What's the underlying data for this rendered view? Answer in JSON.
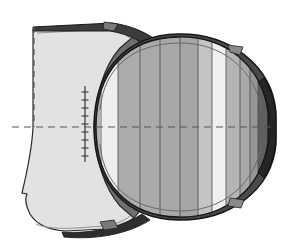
{
  "figure": {
    "title": "",
    "caption": "",
    "type": "technical-cad-render",
    "canvas": {
      "width": 284,
      "height": 250,
      "background": "#ffffff"
    }
  },
  "palette": {
    "background": "#ffffff",
    "outline": "#1a1a1a",
    "outline_soft": "#4a4a4a",
    "lightest": "#f2f2f2",
    "light": "#e2e2e2",
    "light_mid": "#d2d2d2",
    "mid": "#b4b4b4",
    "mid_dark": "#a2a2a2",
    "dark": "#8c8c8c",
    "darker": "#6f6f6f",
    "darkest": "#4f4f4f",
    "near_black": "#3a3a3a",
    "centerline": "#555555"
  },
  "geometry": {
    "centerline_y": 127,
    "centerline_x_start": 12,
    "centerline_x_end": 276,
    "vertical_dashed_x": 34,
    "vertical_dashed_y_top": 27,
    "vertical_dashed_y_bottom": 127,
    "cut_plane_x": 85,
    "body_left_x": 86,
    "body_right_x": 268,
    "body_top_y": 36,
    "body_bottom_y": 214
  },
  "left_flange": {
    "name": "upstream-flange-cutaway",
    "fill": "#e2e2e2",
    "shadow_fill": "#6f6f6f",
    "top_y": 26,
    "bottom_y": 226,
    "left_x": 12,
    "right_x": 120
  },
  "barrel": {
    "name": "barrel-body",
    "left_x": 86,
    "right_x": 270,
    "top_y": 36,
    "bottom_y": 214,
    "stripe_count": 12
  },
  "chart_data": {
    "type": "bar",
    "xlabel": "Band index",
    "ylabel": "Gray level (0-255)",
    "categories": [
      "1",
      "2",
      "3",
      "4",
      "5",
      "6",
      "7",
      "8",
      "9",
      "10",
      "11",
      "12"
    ],
    "values": [
      178,
      238,
      172,
      170,
      168,
      166,
      196,
      240,
      180,
      168,
      150,
      95
    ],
    "ylim": [
      0,
      255
    ],
    "grid": false,
    "legend": null,
    "series": [
      {
        "name": "band_gray",
        "values": [
          178,
          238,
          172,
          170,
          168,
          166,
          196,
          240,
          180,
          168,
          150,
          95
        ]
      },
      {
        "name": "band_left_x",
        "values": [
          86,
          100,
          118,
          140,
          160,
          180,
          198,
          212,
          226,
          240,
          250,
          258
        ]
      },
      {
        "name": "band_right_x",
        "values": [
          100,
          118,
          140,
          160,
          180,
          198,
          212,
          226,
          240,
          250,
          258,
          270
        ]
      }
    ]
  },
  "bands": [
    {
      "index": 1,
      "x": 86,
      "w": 14,
      "fill": "#b2b2b2"
    },
    {
      "index": 2,
      "x": 100,
      "w": 18,
      "fill": "#eeeeee"
    },
    {
      "index": 3,
      "x": 118,
      "w": 22,
      "fill": "#acacac"
    },
    {
      "index": 4,
      "x": 140,
      "w": 20,
      "fill": "#aaaaaa"
    },
    {
      "index": 5,
      "x": 160,
      "w": 20,
      "fill": "#a8a8a8"
    },
    {
      "index": 6,
      "x": 180,
      "w": 18,
      "fill": "#a6a6a6"
    },
    {
      "index": 7,
      "x": 198,
      "w": 14,
      "fill": "#c4c4c4"
    },
    {
      "index": 8,
      "x": 212,
      "w": 14,
      "fill": "#f0f0f0"
    },
    {
      "index": 9,
      "x": 226,
      "w": 14,
      "fill": "#b4b4b4"
    },
    {
      "index": 10,
      "x": 240,
      "w": 10,
      "fill": "#a8a8a8"
    },
    {
      "index": 11,
      "x": 250,
      "w": 8,
      "fill": "#969696"
    },
    {
      "index": 12,
      "x": 258,
      "w": 12,
      "fill": "#5f5f5f"
    }
  ],
  "tabs": [
    {
      "name": "tab-top-left",
      "x": 108,
      "y": 24,
      "fill": "#7a7a7a"
    },
    {
      "name": "tab-top-right",
      "x": 232,
      "y": 46,
      "fill": "#8a8a8a"
    },
    {
      "name": "tab-bottom-left",
      "x": 104,
      "y": 222,
      "fill": "#7a7a7a"
    },
    {
      "name": "tab-bottom-right",
      "x": 234,
      "y": 200,
      "fill": "#8a8a8a"
    }
  ],
  "tick_marks": {
    "name": "cut-edge-ticks",
    "x": 85,
    "count": 9,
    "y_values": [
      92,
      100,
      108,
      116,
      124,
      132,
      140,
      148,
      156
    ],
    "length": 7,
    "color": "#3a3a3a"
  },
  "annotations": {
    "centerline_style": "dashed",
    "cut_section_label": "",
    "units": ""
  }
}
